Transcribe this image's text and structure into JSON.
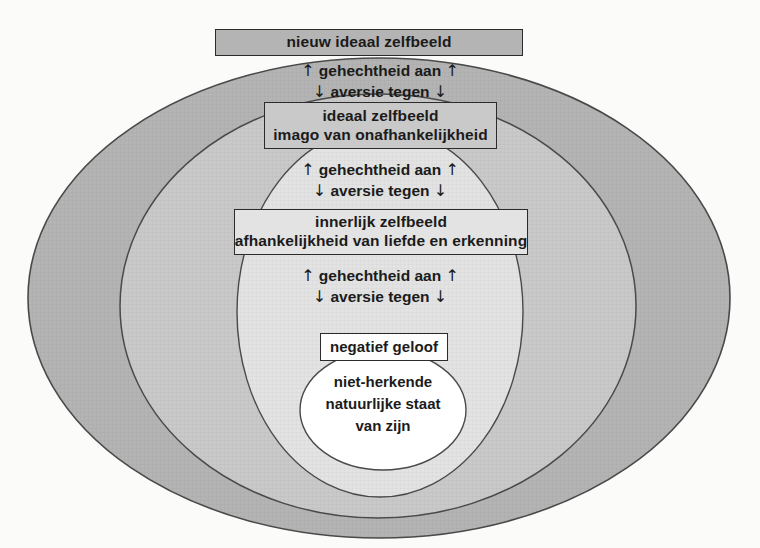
{
  "diagram": {
    "title": "nieuw ideaal zelfbeeld",
    "background_color": "#fbfbfa",
    "rings": [
      {
        "name": "outer-ring",
        "fill": "#b4b4b4",
        "stroke": "#4a4a4a",
        "cx": 379,
        "cy": 298,
        "rx": 351,
        "ry": 240
      },
      {
        "name": "second-ring",
        "fill": "#c9c9c9",
        "stroke": "#4a4a4a",
        "cx": 378,
        "cy": 306,
        "rx": 258,
        "ry": 212
      },
      {
        "name": "third-ring",
        "fill": "#e3e3e3",
        "stroke": "#4a4a4a",
        "cx": 380,
        "cy": 312,
        "rx": 143,
        "ry": 185
      },
      {
        "name": "core-circle",
        "fill": "#ffffff",
        "stroke": "#4a4a4a",
        "cx": 383,
        "cy": 410,
        "rx": 83,
        "ry": 60
      }
    ],
    "boxes": [
      {
        "name": "nieuw-ideaal-zelfbeeld",
        "lines": [
          "nieuw ideaal zelfbeeld"
        ],
        "fill": "#b4b4b4"
      },
      {
        "name": "ideaal-zelfbeeld",
        "lines": [
          "ideaal zelfbeeld",
          "imago van onafhankelijkheid"
        ],
        "fill": "#c9c9c9"
      },
      {
        "name": "innerlijk-zelfbeeld",
        "lines": [
          "innerlijk zelfbeeld",
          "afhankelijkheid van liefde en erkenning"
        ],
        "fill": "#e3e3e3"
      },
      {
        "name": "negatief-geloof",
        "lines": [
          "negatief geloof"
        ],
        "fill": "#fdfdfd"
      }
    ],
    "arrow_labels": [
      {
        "name": "arrows-between-outer-and-second",
        "up_arrow": "↑",
        "down_arrow": "↓",
        "up_text": "gehechtheid aan",
        "down_text": "aversie tegen"
      },
      {
        "name": "arrows-between-second-and-third",
        "up_arrow": "↑",
        "down_arrow": "↓",
        "up_text": "gehechtheid aan",
        "down_text": "aversie tegen"
      },
      {
        "name": "arrows-between-third-and-core",
        "up_arrow": "↑",
        "down_arrow": "↓",
        "up_text": "gehechtheid aan",
        "down_text": "aversie tegen"
      }
    ],
    "core_text": {
      "name": "natuurlijke-staat",
      "lines": [
        "niet-herkende",
        "natuurlijke staat",
        "van zijn"
      ]
    }
  }
}
